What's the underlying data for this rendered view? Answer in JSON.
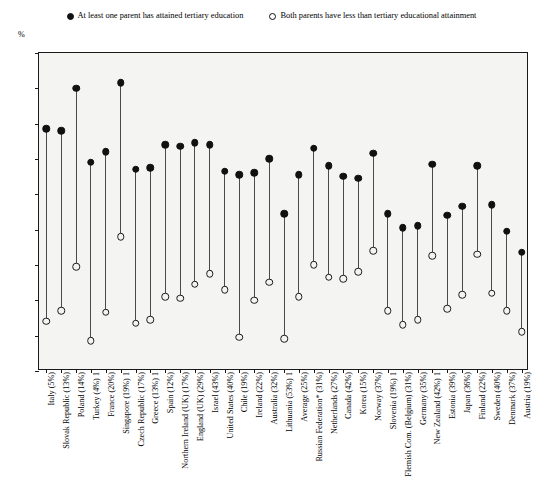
{
  "legend": {
    "entries": [
      {
        "marker": "filled-circle-icon",
        "label": "At least one parent has attained tertiary education"
      },
      {
        "marker": "open-circle-icon",
        "label": "Both parents have less than tertiary educational attainment"
      }
    ]
  },
  "axis": {
    "unit_label": "%",
    "y_ticks": [
      "0",
      "10",
      "20",
      "30",
      "40",
      "50",
      "60",
      "70",
      "80",
      "90"
    ]
  },
  "chart_data": {
    "type": "scatter",
    "title": "",
    "subtitle": "",
    "xlabel": "",
    "ylabel": "%",
    "ylim": [
      0,
      90
    ],
    "ytick_step": 10,
    "grid": false,
    "legend_position": "top-center",
    "marker_styles": {
      "At least one parent has attained tertiary education": "filled-circle",
      "Both parents have less than tertiary educational attainment": "open-circle"
    },
    "categories": [
      "Italy (5%)",
      "Slovak Republic (13%)",
      "Poland (14%)",
      "Turkey (4%) 1",
      "France (20%)",
      "Singapore (19%) 1",
      "Czech Republic (17%)",
      "Greece (13%) 1",
      "Spain (12%)",
      "Northern Ireland (UK) (17%)",
      "England (UK) (29%)",
      "Israel (43%)",
      "United States (40%)",
      "Chile (19%)",
      "Ireland (22%)",
      "Australia (32%)",
      "Lithuania (53%) 1",
      "Average (25%)",
      "Russian Federation* (31%)",
      "Netherlands (27%)",
      "Canada (42%)",
      "Korea (15%)",
      "Norway (37%)",
      "Slovenia (19%) 1",
      "Flemish Com. (Belgium) (31%)",
      "Germany (35%)",
      "New Zealand (42%) 1",
      "Estonia (39%)",
      "Japan (36%)",
      "Finland (22%)",
      "Sweden (40%)",
      "Denmark (37%)",
      "Austria (19%)"
    ],
    "series": [
      {
        "name": "At least one parent has attained tertiary education",
        "marker": "filled-circle",
        "values": [
          68,
          67.5,
          79.5,
          58.5,
          61.5,
          81,
          56.5,
          57,
          63.5,
          63,
          64,
          63.5,
          56,
          55,
          55.5,
          59.5,
          44,
          55,
          62.5,
          57.5,
          54.5,
          54,
          61,
          44,
          40,
          40.5,
          58,
          43.5,
          46,
          57.5,
          46.5,
          39,
          33
        ]
      },
      {
        "name": "Both parents have less than tertiary educational attainment",
        "marker": "open-circle",
        "values": [
          13.5,
          16.5,
          29,
          8,
          16,
          37.5,
          13,
          14,
          20.5,
          20,
          24,
          27,
          22.5,
          9,
          19.5,
          24.5,
          8.5,
          20.5,
          29.5,
          26,
          25.5,
          27.5,
          33.5,
          16.5,
          12.5,
          14,
          32,
          17,
          21,
          32.5,
          21.5,
          16.5,
          10.5
        ]
      }
    ]
  }
}
